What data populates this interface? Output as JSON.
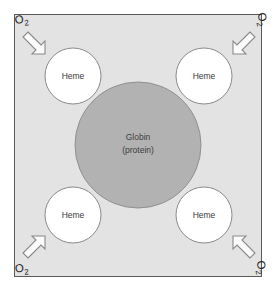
{
  "figure": {
    "panel": {
      "background_color": "#e3e3e3",
      "border_color": "#5a5a5a"
    },
    "center": {
      "name": "globin",
      "line1": "Globin",
      "line2": "(protein)",
      "fill_color": "#b2b2b2"
    },
    "subunits": [
      {
        "position": "top-left",
        "label": "Heme"
      },
      {
        "position": "top-right",
        "label": "Heme"
      },
      {
        "position": "bottom-left",
        "label": "Heme"
      },
      {
        "position": "bottom-right",
        "label": "Heme"
      }
    ],
    "ligands": [
      {
        "position": "top-left",
        "symbol": "O",
        "subscript": "2"
      },
      {
        "position": "top-right",
        "symbol": "O",
        "subscript": "2"
      },
      {
        "position": "bottom-left",
        "symbol": "O",
        "subscript": "2"
      },
      {
        "position": "bottom-right",
        "symbol": "O",
        "subscript": "2"
      }
    ]
  }
}
